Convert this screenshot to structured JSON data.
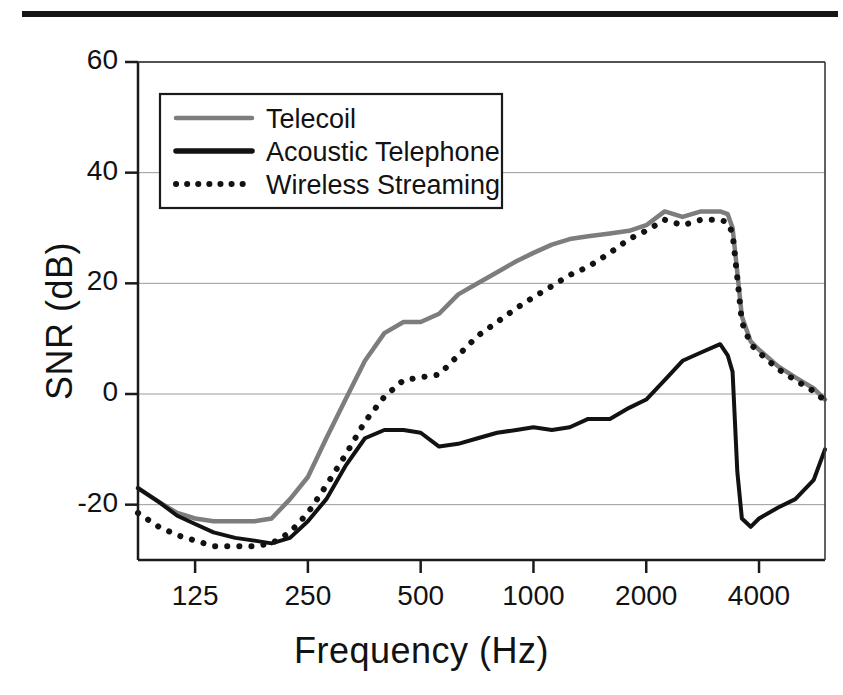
{
  "figure": {
    "top_rule_color": "#161616",
    "background": "#ffffff"
  },
  "axes": {
    "x_title": "Frequency (Hz)",
    "y_title": "SNR (dB)",
    "x_ticks": [
      "125",
      "250",
      "500",
      "1000",
      "2000",
      "4000"
    ],
    "y_ticks": [
      "60",
      "40",
      "20",
      "0",
      "-20"
    ]
  },
  "legend": {
    "items": [
      {
        "label": "Telecoil",
        "style": "solid",
        "color": "#7d7d7d"
      },
      {
        "label": "Acoustic Telephone",
        "style": "solid",
        "color": "#121212"
      },
      {
        "label": "Wireless Streaming",
        "style": "dotted",
        "color": "#121212"
      }
    ]
  },
  "chart_data": {
    "type": "line",
    "title": "",
    "xlabel": "Frequency (Hz)",
    "ylabel": "SNR (dB)",
    "xscale": "log",
    "xlim": [
      88,
      6000
    ],
    "ylim": [
      -30,
      60
    ],
    "x_ticks": [
      125,
      250,
      500,
      1000,
      2000,
      4000
    ],
    "y_ticks": [
      -20,
      0,
      20,
      40,
      60
    ],
    "grid": "horizontal",
    "legend_position": "upper-left-inside",
    "x": [
      88,
      100,
      112,
      125,
      140,
      160,
      180,
      200,
      224,
      250,
      280,
      315,
      355,
      400,
      450,
      500,
      560,
      630,
      710,
      800,
      900,
      1000,
      1120,
      1250,
      1400,
      1600,
      1800,
      2000,
      2240,
      2500,
      2800,
      3150,
      3300,
      3400,
      3500,
      3600,
      3800,
      4000,
      4500,
      5000,
      5600,
      6000
    ],
    "series": [
      {
        "name": "Telecoil",
        "color": "#7d7d7d",
        "style": "solid",
        "values": [
          -17.0,
          -19.5,
          -21.5,
          -22.5,
          -23.0,
          -23.0,
          -23.0,
          -22.5,
          -19.0,
          -15.0,
          -8.0,
          -1.0,
          6.0,
          11.0,
          13.0,
          13.0,
          14.5,
          18.0,
          20.0,
          22.0,
          24.0,
          25.5,
          27.0,
          28.0,
          28.5,
          29.0,
          29.5,
          30.5,
          33.0,
          32.0,
          33.0,
          33.0,
          32.5,
          30.0,
          22.0,
          14.0,
          9.5,
          8.0,
          5.0,
          3.0,
          1.0,
          -1.0
        ]
      },
      {
        "name": "Acoustic Telephone",
        "color": "#121212",
        "style": "solid",
        "values": [
          -17.0,
          -19.5,
          -22.0,
          -23.5,
          -25.0,
          -26.0,
          -26.5,
          -27.0,
          -26.0,
          -23.0,
          -19.0,
          -13.0,
          -8.0,
          -6.5,
          -6.5,
          -7.0,
          -9.5,
          -9.0,
          -8.0,
          -7.0,
          -6.5,
          -6.0,
          -6.5,
          -6.0,
          -4.5,
          -4.5,
          -2.5,
          -1.0,
          2.5,
          6.0,
          7.5,
          9.0,
          7.0,
          4.0,
          -14.0,
          -22.5,
          -24.0,
          -22.5,
          -20.5,
          -19.0,
          -15.5,
          -10.0
        ]
      },
      {
        "name": "Wireless Streaming",
        "color": "#121212",
        "style": "dotted",
        "values": [
          -21.5,
          -24.0,
          -25.5,
          -26.5,
          -27.5,
          -27.5,
          -27.5,
          -27.0,
          -25.0,
          -21.5,
          -16.5,
          -11.0,
          -5.0,
          -0.5,
          2.5,
          3.0,
          3.5,
          7.0,
          10.5,
          13.0,
          15.5,
          17.5,
          19.5,
          21.5,
          23.0,
          25.5,
          28.0,
          29.5,
          31.5,
          30.5,
          31.5,
          31.5,
          31.0,
          29.0,
          21.0,
          13.0,
          9.0,
          7.5,
          4.5,
          2.5,
          0.5,
          -1.2
        ]
      }
    ]
  }
}
